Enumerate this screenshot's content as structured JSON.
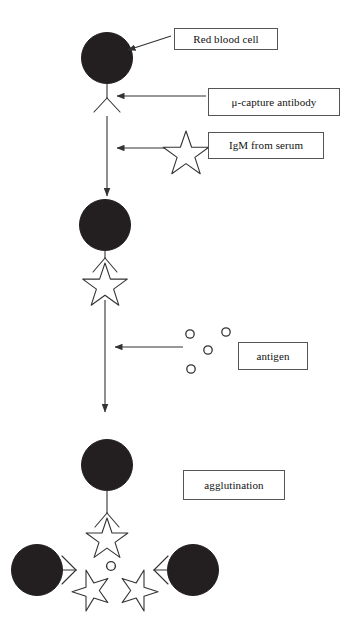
{
  "figure": {
    "background_color": "#ffffff",
    "width": 352,
    "height": 621
  },
  "palette": {
    "cell_fill": "#231f20",
    "stroke": "#333333",
    "box_border": "#555555",
    "text": "#111111",
    "page": "#ffffff"
  },
  "labels": {
    "red_blood_cell": "Red blood cell",
    "capture_antibody": "μ-capture antibody",
    "igm_from_serum": "IgM from serum",
    "antigen": "antigen",
    "agglutination": "agglutination"
  },
  "stages": [
    {
      "name": "stage-1-coated-cell",
      "description": "Red blood cell coated with mu-capture antibody",
      "elements": [
        "red-blood-cell",
        "capture-antibody"
      ]
    },
    {
      "name": "stage-2-igm-bound",
      "description": "IgM from serum captured by the mu-capture antibody",
      "elements": [
        "red-blood-cell",
        "capture-antibody",
        "igm-star"
      ]
    },
    {
      "name": "stage-3-agglutination",
      "description": "Antigen cross-links IgM on three coated cells causing agglutination",
      "elements": [
        "red-blood-cell",
        "capture-antibody",
        "igm-star",
        "antigen-circle"
      ]
    }
  ],
  "icons": {
    "red_blood_cell": "filled-circle-icon",
    "capture_antibody": "y-antibody-icon",
    "igm": "five-point-star-icon",
    "antigen": "small-open-circle-icon",
    "flow": "down-arrow-icon",
    "pointer": "left-arrow-icon"
  },
  "counts": {
    "antigen_particles_in_pool": 4,
    "cells_in_agglutinate": 3,
    "igm_stars_in_agglutinate": 3,
    "antigen_in_agglutinate": 1
  }
}
